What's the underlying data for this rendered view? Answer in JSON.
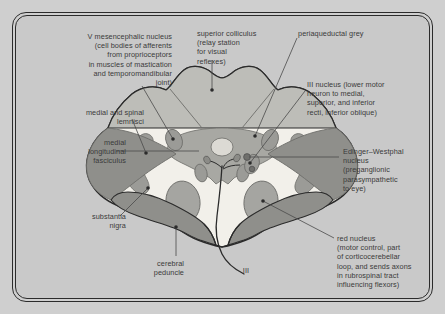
{
  "figure": {
    "frame": {
      "border_color": "#2b2b2b",
      "page_background": "#cfcfcf",
      "panel_background": "#c9c9c9"
    },
    "palette": {
      "background": "#c9c9c9",
      "white_matter": "#f2f0ea",
      "light_grey_tissue": "#dcdad4",
      "mid_grey_tissue": "#bdbdb8",
      "dark_grey_nuclei": "#9b9b97",
      "darker_grey_band": "#8f8f8b",
      "outline": "#2b2b2b",
      "leader_line": "#4a4a4a",
      "text": "#3a3a3a"
    },
    "labels": [
      {
        "id": "v-mesencephalic-nucleus",
        "text": "V mesencephalic nucleus\n(cell bodies of afferents\nfrom proprioceptors\nin muscles of mastication\nand temporomandibular\njoint)",
        "align": "right",
        "x": 18,
        "y": 16,
        "width": 138
      },
      {
        "id": "medial-and-spinal-lemnisci",
        "text": "medial and spinal\nlemnisci",
        "align": "right",
        "x": 18,
        "y": 92,
        "width": 110
      },
      {
        "id": "medial-longitudinal-fasciculus",
        "text": "medial\nlongitudinal\nfasciculus",
        "align": "right",
        "x": 18,
        "y": 122,
        "width": 92
      },
      {
        "id": "substantia-nigra",
        "text": "substantia\nnigra",
        "align": "right",
        "x": 18,
        "y": 196,
        "width": 92
      },
      {
        "id": "cerebral-peduncle",
        "text": "cerebral\npeduncle",
        "align": "right",
        "x": 96,
        "y": 243,
        "width": 72
      },
      {
        "id": "superior-colliculus",
        "text": "superior colliculus\n(relay station\nfor visual\nreflexes)",
        "align": "left",
        "x": 181,
        "y": 13,
        "width": 92
      },
      {
        "id": "periaqueductal-grey",
        "text": "periaqueductal grey",
        "align": "left",
        "x": 282,
        "y": 13,
        "width": 96
      },
      {
        "id": "iii-nucleus",
        "text": "III nucleus (lower motor\nneuron to medial,\nsuperior, and inferior\nrecti, inferior oblique)",
        "align": "left",
        "x": 291,
        "y": 64,
        "width": 122
      },
      {
        "id": "edinger-westphal-nucleus",
        "text": "Edinger–Westphal\nnucleus\n(preganglionic\nparasympathetic\nto eye)",
        "align": "left",
        "x": 327,
        "y": 131,
        "width": 100
      },
      {
        "id": "red-nucleus",
        "text": "red nucleus\n(motor control, part\nof corticocerebellar\nloop, and sends axons\nin rubrospinal tract\ninfluencing flexors)",
        "align": "left",
        "x": 321,
        "y": 218,
        "width": 112
      },
      {
        "id": "nerve-iii",
        "text": "III",
        "align": "center",
        "x": 223,
        "y": 250,
        "width": 14
      }
    ],
    "structures": [
      {
        "id": "tectum-superior-colliculus",
        "label": "superior colliculus",
        "fill": "#bdbdb8"
      },
      {
        "id": "periaqueductal-grey-region",
        "label": "periaqueductal grey",
        "fill": "#a8a8a3"
      },
      {
        "id": "cerebral-aqueduct",
        "label": "cerebral aqueduct",
        "fill": "#dcdad4"
      },
      {
        "id": "v-mesencephalic-nucleus-left",
        "label": "V mesencephalic nucleus",
        "fill": "#9b9b97"
      },
      {
        "id": "v-mesencephalic-nucleus-right",
        "label": "V mesencephalic nucleus",
        "fill": "#9b9b97"
      },
      {
        "id": "medial-lemniscus-left",
        "label": "medial and spinal lemnisci",
        "fill": "#9b9b97"
      },
      {
        "id": "medial-lemniscus-right",
        "label": "medial and spinal lemnisci",
        "fill": "#9b9b97"
      },
      {
        "id": "mlf-left",
        "label": "medial longitudinal fasciculus",
        "fill": "#9b9b97"
      },
      {
        "id": "mlf-right",
        "label": "medial longitudinal fasciculus",
        "fill": "#9b9b97"
      },
      {
        "id": "iii-nucleus-region",
        "label": "III nucleus",
        "fill": "#9b9b97"
      },
      {
        "id": "edinger-westphal-region",
        "label": "Edinger-Westphal nucleus",
        "fill": "#9b9b97"
      },
      {
        "id": "red-nucleus-left",
        "label": "red nucleus",
        "fill": "#9b9b97"
      },
      {
        "id": "red-nucleus-right",
        "label": "red nucleus",
        "fill": "#9b9b97"
      },
      {
        "id": "substantia-nigra-left",
        "label": "substantia nigra",
        "fill": "#8f8f8b"
      },
      {
        "id": "substantia-nigra-right",
        "label": "substantia nigra",
        "fill": "#8f8f8b"
      },
      {
        "id": "cerebral-peduncle-left",
        "label": "cerebral peduncle",
        "fill": "#8f8f8b"
      },
      {
        "id": "cerebral-peduncle-right",
        "label": "cerebral peduncle",
        "fill": "#8f8f8b"
      },
      {
        "id": "oculomotor-nerve-fibres",
        "label": "III nerve fibres",
        "fill": "none"
      }
    ]
  }
}
